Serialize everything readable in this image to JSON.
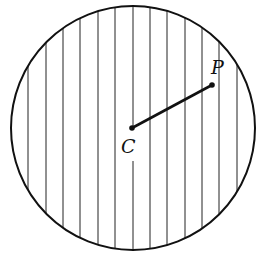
{
  "diagram": {
    "type": "shaded-circle",
    "circle": {
      "cx": 133,
      "cy": 128,
      "r": 122
    },
    "hatch": {
      "orientation": "vertical",
      "x_positions": [
        28,
        46,
        63,
        80,
        98,
        115,
        133,
        150,
        167,
        185,
        202,
        219,
        237
      ]
    },
    "points": [
      {
        "name": "C",
        "label": "C",
        "x": 132,
        "y": 128,
        "label_x": 121,
        "label_y": 153
      },
      {
        "name": "P",
        "label": "P",
        "x": 212,
        "y": 85,
        "label_x": 211,
        "label_y": 74
      }
    ],
    "segment": {
      "from": "C",
      "to": "P"
    },
    "colors": {
      "stroke": "#111111",
      "background": "#ffffff"
    }
  }
}
